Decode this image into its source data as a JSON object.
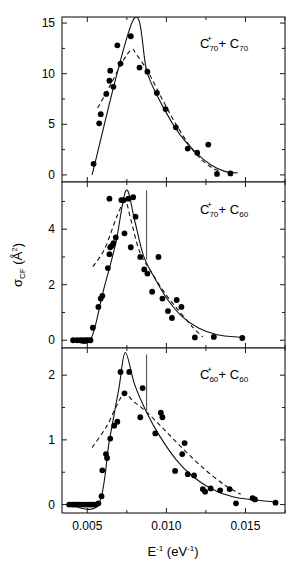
{
  "figure": {
    "background_color": "#ffffff",
    "line_color": "#000000",
    "marker_color": "#000000",
    "xlabel_base": "E",
    "xlabel_sup": "-1",
    "xlabel_units": "(eV",
    "xlabel_units_sup": "-1",
    "xlabel_units_close": ")",
    "ylabel_sigma": "σ",
    "ylabel_sigma_sub": "CF",
    "ylabel_units": " (Å",
    "ylabel_units_sup": "2",
    "ylabel_units_close": ")"
  },
  "chart_data": [
    {
      "type": "scatter",
      "panel": 1,
      "title": "",
      "label_main": "C",
      "label_sub1": "70",
      "label_sup1": "+",
      "label_plus": " + C",
      "label_sub2": "70",
      "legend_text": "C70+ + C70",
      "xlabel": "E^-1 (eV^-1)",
      "ylabel": "sigma_CF (A^2)",
      "xlim": [
        0.0034,
        0.0175
      ],
      "ylim": [
        -0.7,
        15.6
      ],
      "xticks": [
        0.005,
        0.01,
        0.015
      ],
      "xtick_labels": [
        "0.005",
        "0.010",
        "0.015"
      ],
      "xminor": [
        0.0025,
        0.0075,
        0.0125,
        0.0175
      ],
      "yticks": [
        0,
        5,
        10,
        15
      ],
      "ytick_labels": [
        "0",
        "5",
        "10",
        "15"
      ],
      "yminor": [
        2.5,
        7.5,
        12.5
      ],
      "grid": false,
      "points": [
        {
          "x": 0.0054,
          "y": 1.1
        },
        {
          "x": 0.00575,
          "y": 5.1
        },
        {
          "x": 0.00585,
          "y": 6.0
        },
        {
          "x": 0.0062,
          "y": 8.0
        },
        {
          "x": 0.0064,
          "y": 9.3
        },
        {
          "x": 0.00645,
          "y": 10.3
        },
        {
          "x": 0.00665,
          "y": 8.7
        },
        {
          "x": 0.0069,
          "y": 12.8
        },
        {
          "x": 0.0071,
          "y": 11.0
        },
        {
          "x": 0.00775,
          "y": 13.7
        },
        {
          "x": 0.0083,
          "y": 10.6
        },
        {
          "x": 0.0088,
          "y": 10.2
        },
        {
          "x": 0.0094,
          "y": 8.1
        },
        {
          "x": 0.00995,
          "y": 6.5
        },
        {
          "x": 0.0106,
          "y": 4.7
        },
        {
          "x": 0.01135,
          "y": 2.6
        },
        {
          "x": 0.01195,
          "y": 2.2
        },
        {
          "x": 0.01265,
          "y": 3.0
        },
        {
          "x": 0.0132,
          "y": 0.1
        },
        {
          "x": 0.01405,
          "y": 0.15
        }
      ],
      "solid_curve": [
        {
          "x": 0.0053,
          "y": 0.0
        },
        {
          "x": 0.0079,
          "y": 15.3
        },
        {
          "x": 0.0088,
          "y": 10.0
        },
        {
          "x": 0.0099,
          "y": 6.4
        },
        {
          "x": 0.0108,
          "y": 4.1
        },
        {
          "x": 0.0118,
          "y": 2.3
        },
        {
          "x": 0.0128,
          "y": 1.0
        },
        {
          "x": 0.0137,
          "y": 0.35
        },
        {
          "x": 0.0145,
          "y": 0.2
        }
      ],
      "dashed_curve": [
        {
          "x": 0.00565,
          "y": 6.6
        },
        {
          "x": 0.0064,
          "y": 8.7
        },
        {
          "x": 0.0072,
          "y": 11.1
        },
        {
          "x": 0.0078,
          "y": 12.4
        },
        {
          "x": 0.0081,
          "y": 11.9
        },
        {
          "x": 0.0088,
          "y": 10.3
        },
        {
          "x": 0.0098,
          "y": 7.3
        },
        {
          "x": 0.0108,
          "y": 4.5
        },
        {
          "x": 0.0118,
          "y": 2.2
        },
        {
          "x": 0.0127,
          "y": 0.9
        },
        {
          "x": 0.0133,
          "y": 0.4
        }
      ],
      "vline": null
    },
    {
      "type": "scatter",
      "panel": 2,
      "title": "",
      "label_main": "C",
      "label_sub1": "70",
      "label_sup1": "+",
      "label_plus": " + C",
      "label_sub2": "60",
      "legend_text": "C70+ + C60",
      "xlabel": "E^-1 (eV^-1)",
      "ylabel": "sigma_CF (A^2)",
      "xlim": [
        0.0034,
        0.0175
      ],
      "ylim": [
        -0.28,
        5.7
      ],
      "xticks": [
        0.005,
        0.01,
        0.015
      ],
      "xtick_labels": [
        "0.005",
        "0.010",
        "0.015"
      ],
      "xminor": [
        0.0025,
        0.0075,
        0.0125,
        0.0175
      ],
      "yticks": [
        0,
        2,
        4
      ],
      "ytick_labels": [
        "0",
        "2",
        "4"
      ],
      "yminor": [
        1,
        3,
        5
      ],
      "grid": false,
      "points": [
        {
          "x": 0.0041,
          "y": 0.0
        },
        {
          "x": 0.00435,
          "y": 0.0
        },
        {
          "x": 0.00455,
          "y": 0.0
        },
        {
          "x": 0.00472,
          "y": 0.0
        },
        {
          "x": 0.0049,
          "y": 0.0
        },
        {
          "x": 0.00505,
          "y": 0.0
        },
        {
          "x": 0.0052,
          "y": 0.0
        },
        {
          "x": 0.00535,
          "y": 0.45
        },
        {
          "x": 0.0057,
          "y": 1.2
        },
        {
          "x": 0.00585,
          "y": 1.5
        },
        {
          "x": 0.00595,
          "y": 1.6
        },
        {
          "x": 0.0063,
          "y": 2.6
        },
        {
          "x": 0.0064,
          "y": 3.1
        },
        {
          "x": 0.00645,
          "y": 3.35
        },
        {
          "x": 0.00655,
          "y": 3.4
        },
        {
          "x": 0.00665,
          "y": 3.5
        },
        {
          "x": 0.0068,
          "y": 3.7
        },
        {
          "x": 0.0064,
          "y": 5.1
        },
        {
          "x": 0.00715,
          "y": 5.05
        },
        {
          "x": 0.0073,
          "y": 5.05
        },
        {
          "x": 0.00735,
          "y": 3.85
        },
        {
          "x": 0.0076,
          "y": 5.1
        },
        {
          "x": 0.0079,
          "y": 5.15
        },
        {
          "x": 0.00775,
          "y": 3.35
        },
        {
          "x": 0.00805,
          "y": 4.45
        },
        {
          "x": 0.00835,
          "y": 3.0
        },
        {
          "x": 0.0086,
          "y": 2.55
        },
        {
          "x": 0.0088,
          "y": 2.4
        },
        {
          "x": 0.0091,
          "y": 1.75
        },
        {
          "x": 0.0095,
          "y": 3.0
        },
        {
          "x": 0.00975,
          "y": 1.5
        },
        {
          "x": 0.0101,
          "y": 1.05
        },
        {
          "x": 0.01035,
          "y": 0.8
        },
        {
          "x": 0.01065,
          "y": 1.45
        },
        {
          "x": 0.01095,
          "y": 1.2
        },
        {
          "x": 0.0118,
          "y": 0.1
        },
        {
          "x": 0.013,
          "y": 0.12
        },
        {
          "x": 0.0148,
          "y": 0.08
        }
      ],
      "solid_curve": [
        {
          "x": 0.0041,
          "y": 0.0
        },
        {
          "x": 0.0052,
          "y": 0.02
        },
        {
          "x": 0.006,
          "y": 1.75
        },
        {
          "x": 0.0068,
          "y": 3.5
        },
        {
          "x": 0.00745,
          "y": 5.4
        },
        {
          "x": 0.008,
          "y": 4.3
        },
        {
          "x": 0.00855,
          "y": 3.05
        },
        {
          "x": 0.0093,
          "y": 2.2
        },
        {
          "x": 0.0101,
          "y": 1.45
        },
        {
          "x": 0.011,
          "y": 0.85
        },
        {
          "x": 0.012,
          "y": 0.45
        },
        {
          "x": 0.0132,
          "y": 0.2
        },
        {
          "x": 0.0148,
          "y": 0.1
        }
      ],
      "dashed_curve": [
        {
          "x": 0.00535,
          "y": 2.65
        },
        {
          "x": 0.0061,
          "y": 3.3
        },
        {
          "x": 0.0069,
          "y": 4.5
        },
        {
          "x": 0.0074,
          "y": 5.0
        },
        {
          "x": 0.00775,
          "y": 4.35
        },
        {
          "x": 0.0083,
          "y": 3.2
        },
        {
          "x": 0.009,
          "y": 2.5
        },
        {
          "x": 0.0099,
          "y": 1.7
        },
        {
          "x": 0.0108,
          "y": 1.05
        },
        {
          "x": 0.0117,
          "y": 0.45
        },
        {
          "x": 0.0123,
          "y": 0.12
        }
      ],
      "vline": {
        "x": 0.00875,
        "y_top": 5.4,
        "y_bottom": 2.9
      }
    },
    {
      "type": "scatter",
      "panel": 3,
      "title": "",
      "label_main": "C",
      "label_sub1": "60",
      "label_sup1": "+",
      "label_plus": " + C",
      "label_sub2": "60",
      "legend_text": "C60+ + C60",
      "xlabel": "E^-1 (eV^-1)",
      "ylabel": "sigma_CF (A^2)",
      "xlim": [
        0.0034,
        0.0175
      ],
      "ylim": [
        -0.13,
        2.42
      ],
      "xticks": [
        0.005,
        0.01,
        0.015
      ],
      "xtick_labels": [
        "0.005",
        "0.010",
        "0.015"
      ],
      "xminor": [
        0.0025,
        0.0075,
        0.0125,
        0.0175
      ],
      "yticks": [
        0,
        1,
        2
      ],
      "ytick_labels": [
        "0",
        "1",
        "2"
      ],
      "yminor": [
        0.5,
        1.5
      ],
      "grid": false,
      "points": [
        {
          "x": 0.00385,
          "y": 0.0
        },
        {
          "x": 0.00405,
          "y": 0.0
        },
        {
          "x": 0.0042,
          "y": 0.0
        },
        {
          "x": 0.00435,
          "y": 0.0
        },
        {
          "x": 0.0045,
          "y": 0.0
        },
        {
          "x": 0.00465,
          "y": 0.0
        },
        {
          "x": 0.0048,
          "y": 0.0
        },
        {
          "x": 0.00495,
          "y": 0.0
        },
        {
          "x": 0.0051,
          "y": 0.0
        },
        {
          "x": 0.00525,
          "y": 0.0
        },
        {
          "x": 0.0054,
          "y": 0.0
        },
        {
          "x": 0.00555,
          "y": 0.0
        },
        {
          "x": 0.0057,
          "y": 0.02
        },
        {
          "x": 0.0059,
          "y": 0.13
        },
        {
          "x": 0.00595,
          "y": 0.53
        },
        {
          "x": 0.00625,
          "y": 0.72
        },
        {
          "x": 0.00618,
          "y": 0.78
        },
        {
          "x": 0.00645,
          "y": 1.02
        },
        {
          "x": 0.0067,
          "y": 1.22
        },
        {
          "x": 0.0069,
          "y": 1.28
        },
        {
          "x": 0.0071,
          "y": 2.05
        },
        {
          "x": 0.00735,
          "y": 1.72
        },
        {
          "x": 0.00765,
          "y": 2.05
        },
        {
          "x": 0.00835,
          "y": 1.35
        },
        {
          "x": 0.0085,
          "y": 1.8
        },
        {
          "x": 0.0093,
          "y": 1.1
        },
        {
          "x": 0.00965,
          "y": 1.42
        },
        {
          "x": 0.00975,
          "y": 1.35
        },
        {
          "x": 0.01055,
          "y": 0.52
        },
        {
          "x": 0.011,
          "y": 0.78
        },
        {
          "x": 0.01115,
          "y": 0.95
        },
        {
          "x": 0.01135,
          "y": 0.47
        },
        {
          "x": 0.01175,
          "y": 0.45
        },
        {
          "x": 0.0123,
          "y": 0.24
        },
        {
          "x": 0.01245,
          "y": 0.2
        },
        {
          "x": 0.0128,
          "y": 0.25
        },
        {
          "x": 0.0134,
          "y": 0.22
        },
        {
          "x": 0.014,
          "y": 0.24
        },
        {
          "x": 0.0144,
          "y": 0.02
        },
        {
          "x": 0.01545,
          "y": 0.1
        },
        {
          "x": 0.0156,
          "y": 0.08
        },
        {
          "x": 0.0169,
          "y": 0.03
        }
      ],
      "solid_curve": [
        {
          "x": 0.00385,
          "y": 0.0
        },
        {
          "x": 0.0057,
          "y": 0.0
        },
        {
          "x": 0.0064,
          "y": 1.0
        },
        {
          "x": 0.007,
          "y": 1.8
        },
        {
          "x": 0.0074,
          "y": 2.35
        },
        {
          "x": 0.008,
          "y": 1.85
        },
        {
          "x": 0.0088,
          "y": 1.4
        },
        {
          "x": 0.0096,
          "y": 1.05
        },
        {
          "x": 0.0106,
          "y": 0.7
        },
        {
          "x": 0.0116,
          "y": 0.45
        },
        {
          "x": 0.0128,
          "y": 0.25
        },
        {
          "x": 0.0142,
          "y": 0.12
        },
        {
          "x": 0.0156,
          "y": 0.07
        },
        {
          "x": 0.017,
          "y": 0.04
        }
      ],
      "dashed_curve": [
        {
          "x": 0.0053,
          "y": 0.88
        },
        {
          "x": 0.0062,
          "y": 1.2
        },
        {
          "x": 0.0069,
          "y": 1.55
        },
        {
          "x": 0.00735,
          "y": 1.72
        },
        {
          "x": 0.0079,
          "y": 1.6
        },
        {
          "x": 0.0088,
          "y": 1.42
        },
        {
          "x": 0.0099,
          "y": 1.15
        },
        {
          "x": 0.0111,
          "y": 0.85
        },
        {
          "x": 0.0124,
          "y": 0.55
        },
        {
          "x": 0.0137,
          "y": 0.3
        },
        {
          "x": 0.0147,
          "y": 0.16
        }
      ],
      "vline": {
        "x": 0.00875,
        "y_top": 2.32,
        "y_bottom": 1.45
      }
    }
  ],
  "axes_geometry": {
    "plot_left": 62,
    "plot_right": 285,
    "panel1_top": 17,
    "panel1_bottom": 182,
    "panel2_top": 182,
    "panel2_bottom": 348,
    "panel3_top": 348,
    "panel3_bottom": 513
  }
}
